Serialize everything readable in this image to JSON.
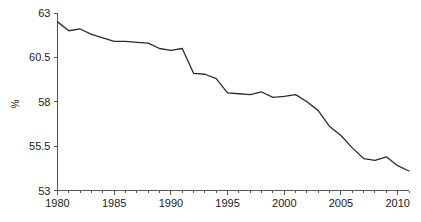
{
  "chart_data": {
    "type": "line",
    "title": "",
    "xlabel": "",
    "ylabel": "%",
    "xlim": [
      1980,
      2011
    ],
    "ylim": [
      53,
      63
    ],
    "grid": false,
    "legend": false,
    "x_major_ticks": [
      1980,
      1985,
      1990,
      1995,
      2000,
      2005,
      2010
    ],
    "x_minor_tick_step": 1,
    "y_ticks": [
      53,
      55.5,
      58,
      60.5,
      63
    ],
    "x_tick_labels": [
      "1980",
      "1985",
      "1990",
      "1995",
      "2000",
      "2005",
      "2010"
    ],
    "y_tick_labels": [
      "53",
      "55.5",
      "58",
      "60.5",
      "63"
    ],
    "line_color": "#2b2b2b",
    "series": [
      {
        "name": "percent",
        "x": [
          1980,
          1981,
          1982,
          1983,
          1984,
          1985,
          1986,
          1987,
          1988,
          1989,
          1990,
          1991,
          1992,
          1993,
          1994,
          1995,
          1996,
          1997,
          1998,
          1999,
          2000,
          2001,
          2002,
          2003,
          2004,
          2005,
          2006,
          2007,
          2008,
          2009,
          2010,
          2011
        ],
        "values": [
          62.5,
          62.0,
          62.1,
          61.8,
          61.6,
          61.4,
          61.4,
          61.35,
          61.3,
          61.0,
          60.9,
          61.0,
          59.6,
          59.55,
          59.3,
          58.5,
          58.45,
          58.4,
          58.55,
          58.25,
          58.3,
          58.4,
          58.0,
          57.5,
          56.6,
          56.1,
          55.4,
          54.8,
          54.7,
          54.9,
          54.4,
          54.1
        ]
      }
    ]
  },
  "axis": {
    "y_title": "%"
  }
}
